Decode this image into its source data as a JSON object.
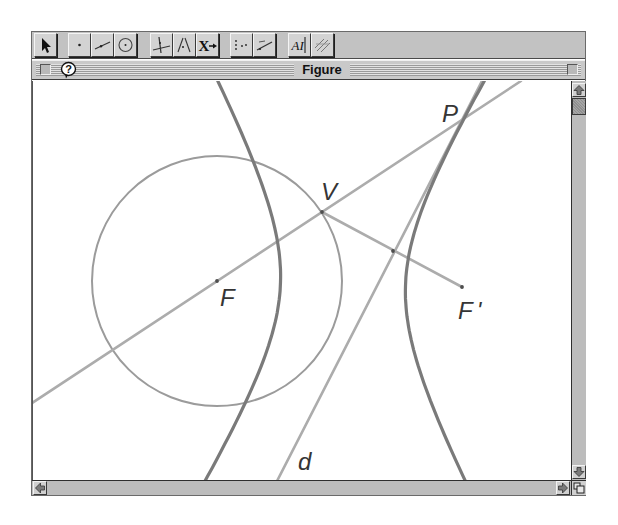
{
  "window": {
    "title": "Figure"
  },
  "toolbar": {
    "tools": [
      {
        "icon": "arrow-pointer-icon",
        "group": 1
      },
      {
        "icon": "point-icon",
        "group": 2
      },
      {
        "icon": "segment-icon",
        "group": 2
      },
      {
        "icon": "circle-icon",
        "group": 2
      },
      {
        "icon": "perpendicular-line-icon",
        "group": 3
      },
      {
        "icon": "parallel-line-icon",
        "group": 3
      },
      {
        "icon": "transform-icon",
        "group": 3,
        "glyph": "X"
      },
      {
        "icon": "locus-icon",
        "group": 4
      },
      {
        "icon": "measure-icon",
        "group": 4
      },
      {
        "icon": "text-label-icon",
        "group": 5,
        "glyph": "AI"
      },
      {
        "icon": "hatch-pattern-icon",
        "group": 5
      }
    ]
  },
  "titlebar": {
    "close_icon": "close-box-icon",
    "help_icon": "help-balloon-icon",
    "help_glyph": "?",
    "zoom_icon": "zoom-box-icon"
  },
  "scrollbars": {
    "vertical": {
      "up_icon": "arrow-up-icon",
      "down_icon": "arrow-down-icon"
    },
    "horizontal": {
      "left_icon": "arrow-left-icon",
      "right_icon": "arrow-right-icon"
    },
    "grow_icon": "resize-grow-icon"
  },
  "canvas": {
    "colors": {
      "conic": "#7a7a7a",
      "circle": "#9b9b9b",
      "line": "#acacac",
      "point": "#4e4e4e",
      "label": "#353535"
    },
    "circle": {
      "name": "circle-centered-F",
      "cx": 216,
      "cy": 281,
      "r": 125
    },
    "lines": [
      {
        "name": "line-FV",
        "x1": 28,
        "y1": 405,
        "x2": 520,
        "y2": 81
      },
      {
        "name": "segment-VF-prime",
        "x1": 321,
        "y1": 212,
        "x2": 461,
        "y2": 287
      },
      {
        "name": "line-d",
        "x1": 274,
        "y1": 485,
        "x2": 481.5,
        "y2": 80
      }
    ],
    "hyperbola": {
      "name": "hyperbola",
      "cx": 342,
      "cy": 284,
      "a": 62.5,
      "b": 108,
      "rotate": 1.7,
      "tmax": 1.6
    },
    "points": [
      {
        "name": "point-F",
        "x": 216,
        "y": 281
      },
      {
        "name": "point-V",
        "x": 321,
        "y": 212
      },
      {
        "name": "point-midpoint",
        "x": 392,
        "y": 251
      },
      {
        "name": "point-F-prime",
        "x": 461,
        "y": 287
      }
    ],
    "labels": [
      {
        "name": "label-F",
        "text": "F",
        "x": 219,
        "y": 306
      },
      {
        "name": "label-V",
        "text": "V",
        "x": 320,
        "y": 200
      },
      {
        "name": "label-P",
        "text": "P",
        "x": 441,
        "y": 122
      },
      {
        "name": "label-F-prime",
        "text": "F'",
        "x": 457,
        "y": 319
      },
      {
        "name": "label-d",
        "text": "d",
        "x": 297,
        "y": 470
      }
    ]
  }
}
